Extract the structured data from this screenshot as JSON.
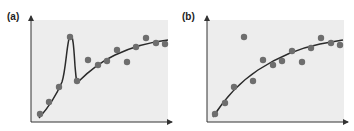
{
  "chart_data": [
    {
      "type": "scatter",
      "title": "(a)",
      "xlabel": "",
      "ylabel": "",
      "grid": false,
      "fit": "curve with sharp spike following outlier",
      "points_px": [
        [
          40,
          114
        ],
        [
          49,
          102
        ],
        [
          59,
          87
        ],
        [
          70,
          37
        ],
        [
          77,
          81
        ],
        [
          88,
          60
        ],
        [
          98,
          65
        ],
        [
          107,
          61
        ],
        [
          117,
          50
        ],
        [
          127,
          62
        ],
        [
          136,
          47
        ],
        [
          146,
          38
        ],
        [
          156,
          43
        ],
        [
          165,
          44
        ]
      ],
      "points": [
        {
          "x": 1,
          "y": 1.0
        },
        {
          "x": 2,
          "y": 2.0
        },
        {
          "x": 3,
          "y": 3.3
        },
        {
          "x": 4,
          "y": 7.8
        },
        {
          "x": 5,
          "y": 3.7
        },
        {
          "x": 6,
          "y": 5.6
        },
        {
          "x": 7,
          "y": 5.2
        },
        {
          "x": 8,
          "y": 5.5
        },
        {
          "x": 9,
          "y": 6.5
        },
        {
          "x": 10,
          "y": 5.4
        },
        {
          "x": 11,
          "y": 6.7
        },
        {
          "x": 12,
          "y": 7.5
        },
        {
          "x": 13,
          "y": 7.1
        },
        {
          "x": 14,
          "y": 7.0
        }
      ]
    },
    {
      "type": "scatter",
      "title": "(b)",
      "xlabel": "",
      "ylabel": "",
      "grid": false,
      "fit": "smooth saturating curve",
      "points_px": [
        [
          215,
          114
        ],
        [
          225,
          103
        ],
        [
          234,
          87
        ],
        [
          244,
          37
        ],
        [
          253,
          81
        ],
        [
          263,
          60
        ],
        [
          273,
          65
        ],
        [
          282,
          61
        ],
        [
          292,
          51
        ],
        [
          302,
          62
        ],
        [
          311,
          48
        ],
        [
          321,
          38
        ],
        [
          331,
          43
        ],
        [
          340,
          45
        ]
      ],
      "points": [
        {
          "x": 1,
          "y": 1.0
        },
        {
          "x": 2,
          "y": 2.0
        },
        {
          "x": 3,
          "y": 3.3
        },
        {
          "x": 4,
          "y": 7.8
        },
        {
          "x": 5,
          "y": 3.7
        },
        {
          "x": 6,
          "y": 5.6
        },
        {
          "x": 7,
          "y": 5.2
        },
        {
          "x": 8,
          "y": 5.5
        },
        {
          "x": 9,
          "y": 6.5
        },
        {
          "x": 10,
          "y": 5.4
        },
        {
          "x": 11,
          "y": 6.7
        },
        {
          "x": 12,
          "y": 7.5
        },
        {
          "x": 13,
          "y": 7.1
        },
        {
          "x": 14,
          "y": 7.0
        }
      ]
    }
  ],
  "labels": {
    "a": "(a)",
    "b": "(b)"
  },
  "colors": {
    "plot_bg": "#ededed",
    "point": "#6e6e6e",
    "curve": "#2b2b2b",
    "axis": "#333333"
  }
}
